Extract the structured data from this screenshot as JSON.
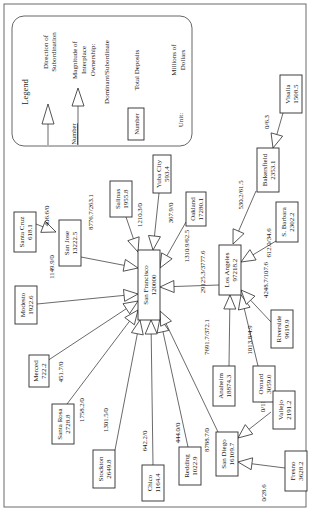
{
  "figure": {
    "orientation": "rotated-90-ccw",
    "frame": {
      "x": 4,
      "y": 4,
      "w": 302,
      "h": 503
    }
  },
  "legend": {
    "title": "Legend",
    "direction_label_1": "Direction of",
    "direction_label_2": "Subordination",
    "magnitude_number": "Number",
    "magnitude_label_1": "Magnitude of",
    "magnitude_label_2": "Interplace",
    "magnitude_label_3": "Ownership:",
    "magnitude_label_4": "Dominant/Subordinate",
    "deposits_box": "Number",
    "deposits_label": "Total Deposits",
    "unit_label": "Unit:",
    "unit_value_1": "Millions of",
    "unit_value_2": "Dollars"
  },
  "nodes": [
    {
      "id": "san-francisco",
      "name": "San Francisco",
      "deposits": "120000",
      "cx": 149,
      "cy": 285,
      "w": 22,
      "h": 70
    },
    {
      "id": "los-angeles",
      "name": "Los Angeles",
      "deposits": "97218.2",
      "cx": 230,
      "cy": 270,
      "w": 22,
      "h": 50
    },
    {
      "id": "san-diego",
      "name": "San Diego",
      "deposits": "16109.7",
      "cx": 227,
      "cy": 454,
      "w": 22,
      "h": 44
    },
    {
      "id": "santa-cruz",
      "name": "Santa Cruz",
      "deposits": "618.1",
      "cx": 25,
      "cy": 232,
      "w": 22,
      "h": 40
    },
    {
      "id": "san-jose",
      "name": "San Jose",
      "deposits": "13222.5",
      "cx": 70,
      "cy": 243,
      "w": 22,
      "h": 46
    },
    {
      "id": "salinas",
      "name": "Salinas",
      "deposits": "1955.8",
      "cx": 121,
      "cy": 199,
      "w": 22,
      "h": 36
    },
    {
      "id": "yuba-city",
      "name": "Yuba City",
      "deposits": "593.4",
      "cx": 162,
      "cy": 174,
      "w": 18,
      "h": 38
    },
    {
      "id": "oakland",
      "name": "Oakland",
      "deposits": "17280.1",
      "cx": 196,
      "cy": 209,
      "w": 20,
      "h": 34
    },
    {
      "id": "modesto",
      "name": "Modesto",
      "deposits": "1922.6",
      "cx": 26,
      "cy": 305,
      "w": 22,
      "h": 38
    },
    {
      "id": "merced",
      "name": "Merced",
      "deposits": "722.2",
      "cx": 39,
      "cy": 371,
      "w": 20,
      "h": 32
    },
    {
      "id": "santa-rosa",
      "name": "Santa Rosa",
      "deposits": "2728.8",
      "cx": 63,
      "cy": 424,
      "w": 22,
      "h": 40
    },
    {
      "id": "stockton",
      "name": "Stockton",
      "deposits": "2649.8",
      "cx": 104,
      "cy": 469,
      "w": 22,
      "h": 38
    },
    {
      "id": "chico",
      "name": "Chico",
      "deposits": "1164.4",
      "cx": 153,
      "cy": 483,
      "w": 22,
      "h": 36
    },
    {
      "id": "redding",
      "name": "Redding",
      "deposits": "1022.9",
      "cx": 190,
      "cy": 466,
      "w": 22,
      "h": 38
    },
    {
      "id": "anaheim",
      "name": "Anaheim",
      "deposits": "18874.3",
      "cx": 224,
      "cy": 386,
      "w": 22,
      "h": 40
    },
    {
      "id": "oxnard",
      "name": "Oxnard",
      "deposits": "3059.0",
      "cx": 264,
      "cy": 384,
      "w": 22,
      "h": 36
    },
    {
      "id": "riverside",
      "name": "Riverside",
      "deposits": "9619.9",
      "cx": 282,
      "cy": 329,
      "w": 22,
      "h": 38
    },
    {
      "id": "s-barbara",
      "name": "S. Barbara",
      "deposits": "2302.2",
      "cx": 287,
      "cy": 222,
      "w": 22,
      "h": 40
    },
    {
      "id": "bakersfield",
      "name": "Bakersfield",
      "deposits": "2353.1",
      "cx": 268,
      "cy": 170,
      "w": 22,
      "h": 44
    },
    {
      "id": "visalia",
      "name": "Visalia",
      "deposits": "1508.5",
      "cx": 291,
      "cy": 94,
      "w": 22,
      "h": 38
    },
    {
      "id": "vallejo",
      "name": "Vallejo",
      "deposits": "2191.2",
      "cx": 284,
      "cy": 410,
      "w": 22,
      "h": 38
    },
    {
      "id": "fresno",
      "name": "Fresno",
      "deposits": "3628.2",
      "cx": 296,
      "cy": 471,
      "w": 22,
      "h": 40
    }
  ],
  "edges": [
    {
      "from": "santa-cruz",
      "to": "san-jose",
      "label": "406.6/0",
      "x1": 36,
      "y1": 224,
      "x2": 56,
      "y2": 232,
      "lx": 49,
      "ly": 216
    },
    {
      "from": "san-jose",
      "to": "san-francisco",
      "label": "8776.7/263.1",
      "x1": 81,
      "y1": 257,
      "x2": 138,
      "y2": 268,
      "lx": 93,
      "ly": 212
    },
    {
      "from": "salinas",
      "to": "san-francisco",
      "label": "1210.3/0",
      "x1": 126,
      "y1": 217,
      "x2": 138,
      "y2": 252,
      "lx": 142,
      "ly": 215
    },
    {
      "from": "yuba-city",
      "to": "san-francisco",
      "label": "367.9/0",
      "x1": 159,
      "y1": 193,
      "x2": 153,
      "y2": 250,
      "lx": 173,
      "ly": 213
    },
    {
      "from": "oakland",
      "to": "san-francisco",
      "label": "1310.9/62.5",
      "x1": 186,
      "y1": 222,
      "x2": 160,
      "y2": 268,
      "lx": 189,
      "ly": 246
    },
    {
      "from": "los-angeles",
      "to": "san-francisco",
      "label": "29125.3/3777.6",
      "x1": 219,
      "y1": 285,
      "x2": 160,
      "y2": 287,
      "lx": 205,
      "ly": 272
    },
    {
      "from": "modesto",
      "to": "san-francisco",
      "label": "1149.9/0",
      "x1": 37,
      "y1": 304,
      "x2": 138,
      "y2": 294,
      "lx": 54,
      "ly": 267
    },
    {
      "from": "merced",
      "to": "san-francisco",
      "label": "451.7/0",
      "x1": 47,
      "y1": 361,
      "x2": 138,
      "y2": 301,
      "lx": 63,
      "ly": 372
    },
    {
      "from": "santa-rosa",
      "to": "san-francisco",
      "label": "1758.2/0",
      "x1": 67,
      "y1": 404,
      "x2": 138,
      "y2": 310,
      "lx": 84,
      "ly": 410
    },
    {
      "from": "stockton",
      "to": "san-francisco",
      "label": "1301.5/0",
      "x1": 115,
      "y1": 450,
      "x2": 140,
      "y2": 320,
      "lx": 108,
      "ly": 420
    },
    {
      "from": "chico",
      "to": "san-francisco",
      "label": "642.2/0",
      "x1": 153,
      "y1": 465,
      "x2": 151,
      "y2": 320,
      "lx": 147,
      "ly": 441
    },
    {
      "from": "redding",
      "to": "san-francisco",
      "label": "444.0/0",
      "x1": 188,
      "y1": 447,
      "x2": 160,
      "y2": 318,
      "lx": 180,
      "ly": 433
    },
    {
      "from": "san-diego",
      "to": "san-francisco",
      "label": "8788.7/0",
      "x1": 218,
      "y1": 432,
      "x2": 160,
      "y2": 311,
      "lx": 209,
      "ly": 440
    },
    {
      "from": "anaheim",
      "to": "los-angeles",
      "label": "7691.7/372.1",
      "x1": 229,
      "y1": 366,
      "x2": 230,
      "y2": 295,
      "lx": 209,
      "ly": 337
    },
    {
      "from": "oxnard",
      "to": "los-angeles",
      "label": "1013.8/4.9",
      "x1": 258,
      "y1": 366,
      "x2": 241,
      "y2": 295,
      "lx": 252,
      "ly": 340
    },
    {
      "from": "riverside",
      "to": "los-angeles",
      "label": "4248.7/107.6",
      "x1": 271,
      "y1": 322,
      "x2": 241,
      "y2": 290,
      "lx": 268,
      "ly": 280
    },
    {
      "from": "s-barbara",
      "to": "los-angeles",
      "label": "612.0/34.6",
      "x1": 276,
      "y1": 241,
      "x2": 241,
      "y2": 262,
      "lx": 271,
      "ly": 243
    },
    {
      "from": "bakersfield",
      "to": "los-angeles",
      "label": "530.2/61.5",
      "x1": 256,
      "y1": 191,
      "x2": 233,
      "y2": 244,
      "lx": 243,
      "ly": 195
    },
    {
      "from": "visalia",
      "to": "bakersfield",
      "label": "0/6.3",
      "x1": 283,
      "y1": 113,
      "x2": 273,
      "y2": 148,
      "lx": 269,
      "ly": 122
    },
    {
      "from": "vallejo",
      "to": "san-diego",
      "label": "0/110.1",
      "x1": 271,
      "y1": 412,
      "x2": 238,
      "y2": 438,
      "lx": 265,
      "ly": 402
    },
    {
      "from": "fresno",
      "to": "san-diego",
      "label": "0/28.6",
      "x1": 285,
      "y1": 468,
      "x2": 238,
      "y2": 462,
      "lx": 266,
      "ly": 493
    }
  ]
}
